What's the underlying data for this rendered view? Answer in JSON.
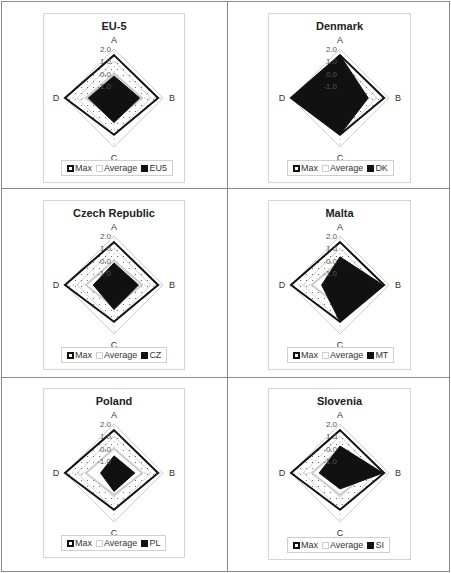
{
  "axes": [
    "A",
    "B",
    "C",
    "D"
  ],
  "ticks": [
    "2.0",
    "1.0",
    "0.0",
    "-1.0"
  ],
  "legend": {
    "max": "Max",
    "average": "Average"
  },
  "colors": {
    "max": "#111111",
    "average": "#cccccc",
    "country": "#111111",
    "grid": "#d0d0d0",
    "border": "#8a8a8a"
  },
  "panels": [
    {
      "title": "EU-5",
      "code": "EU5"
    },
    {
      "title": "Denmark",
      "code": "DK"
    },
    {
      "title": "Czech Republic",
      "code": "CZ"
    },
    {
      "title": "Malta",
      "code": "MT"
    },
    {
      "title": "Poland",
      "code": "PL"
    },
    {
      "title": "Slovenia",
      "code": "SI"
    }
  ],
  "chart_data": [
    {
      "type": "radar",
      "title": "EU-5",
      "categories": [
        "A",
        "B",
        "C",
        "D"
      ],
      "rlim": [
        -2.0,
        2.0
      ],
      "ticks": [
        2.0,
        1.0,
        0.0,
        -1.0
      ],
      "legend_position": "bottom",
      "series": [
        {
          "name": "Max",
          "values": [
            1.5,
            1.6,
            1.0,
            2.0
          ]
        },
        {
          "name": "Average",
          "values": [
            0.0,
            0.3,
            -0.2,
            0.3
          ]
        },
        {
          "name": "EU5",
          "values": [
            -0.2,
            0.1,
            0.0,
            0.1
          ]
        }
      ]
    },
    {
      "type": "radar",
      "title": "Denmark",
      "categories": [
        "A",
        "B",
        "C",
        "D"
      ],
      "rlim": [
        -2.0,
        2.0
      ],
      "ticks": [
        2.0,
        1.0,
        0.0,
        -1.0
      ],
      "legend_position": "bottom",
      "series": [
        {
          "name": "Max",
          "values": [
            1.5,
            1.6,
            1.0,
            2.0
          ]
        },
        {
          "name": "Average",
          "values": [
            0.0,
            0.3,
            -0.2,
            0.3
          ]
        },
        {
          "name": "DK",
          "values": [
            1.5,
            0.3,
            1.0,
            2.0
          ]
        }
      ]
    },
    {
      "type": "radar",
      "title": "Czech Republic",
      "categories": [
        "A",
        "B",
        "C",
        "D"
      ],
      "rlim": [
        -2.0,
        2.0
      ],
      "ticks": [
        2.0,
        1.0,
        0.0,
        -1.0
      ],
      "legend_position": "bottom",
      "series": [
        {
          "name": "Max",
          "values": [
            1.5,
            1.6,
            1.0,
            2.0
          ]
        },
        {
          "name": "Average",
          "values": [
            0.0,
            0.3,
            -0.2,
            0.3
          ]
        },
        {
          "name": "CZ",
          "values": [
            -0.2,
            0.0,
            0.0,
            -0.3
          ]
        }
      ]
    },
    {
      "type": "radar",
      "title": "Malta",
      "categories": [
        "A",
        "B",
        "C",
        "D"
      ],
      "rlim": [
        -2.0,
        2.0
      ],
      "ticks": [
        2.0,
        1.0,
        0.0,
        -1.0
      ],
      "legend_position": "bottom",
      "series": [
        {
          "name": "Max",
          "values": [
            1.5,
            1.6,
            1.0,
            2.0
          ]
        },
        {
          "name": "Average",
          "values": [
            0.0,
            0.3,
            -0.2,
            0.3
          ]
        },
        {
          "name": "MT",
          "values": [
            0.3,
            1.5,
            1.0,
            -0.5
          ]
        }
      ]
    },
    {
      "type": "radar",
      "title": "Poland",
      "categories": [
        "A",
        "B",
        "C",
        "D"
      ],
      "rlim": [
        -2.0,
        2.0
      ],
      "ticks": [
        2.0,
        1.0,
        0.0,
        -1.0
      ],
      "legend_position": "bottom",
      "series": [
        {
          "name": "Max",
          "values": [
            1.5,
            1.6,
            1.0,
            2.0
          ]
        },
        {
          "name": "Average",
          "values": [
            0.0,
            0.3,
            -0.2,
            0.3
          ]
        },
        {
          "name": "PL",
          "values": [
            -0.6,
            -0.3,
            -0.5,
            -0.9
          ]
        }
      ]
    },
    {
      "type": "radar",
      "title": "Slovenia",
      "categories": [
        "A",
        "B",
        "C",
        "D"
      ],
      "rlim": [
        -2.0,
        2.0
      ],
      "ticks": [
        2.0,
        1.0,
        0.0,
        -1.0
      ],
      "legend_position": "bottom",
      "series": [
        {
          "name": "Max",
          "values": [
            1.5,
            1.6,
            1.0,
            2.0
          ]
        },
        {
          "name": "Average",
          "values": [
            0.0,
            0.3,
            -0.2,
            0.3
          ]
        },
        {
          "name": "SI",
          "values": [
            0.2,
            1.5,
            -0.7,
            -0.3
          ]
        }
      ]
    }
  ]
}
